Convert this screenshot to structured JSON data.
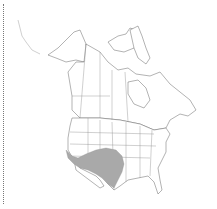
{
  "map": {
    "title": "",
    "region": "North America",
    "range_color": "#a9a9a9",
    "outline_color": "#666666",
    "background": "#ffffff",
    "highlighted_region": "Southwestern United States range"
  }
}
